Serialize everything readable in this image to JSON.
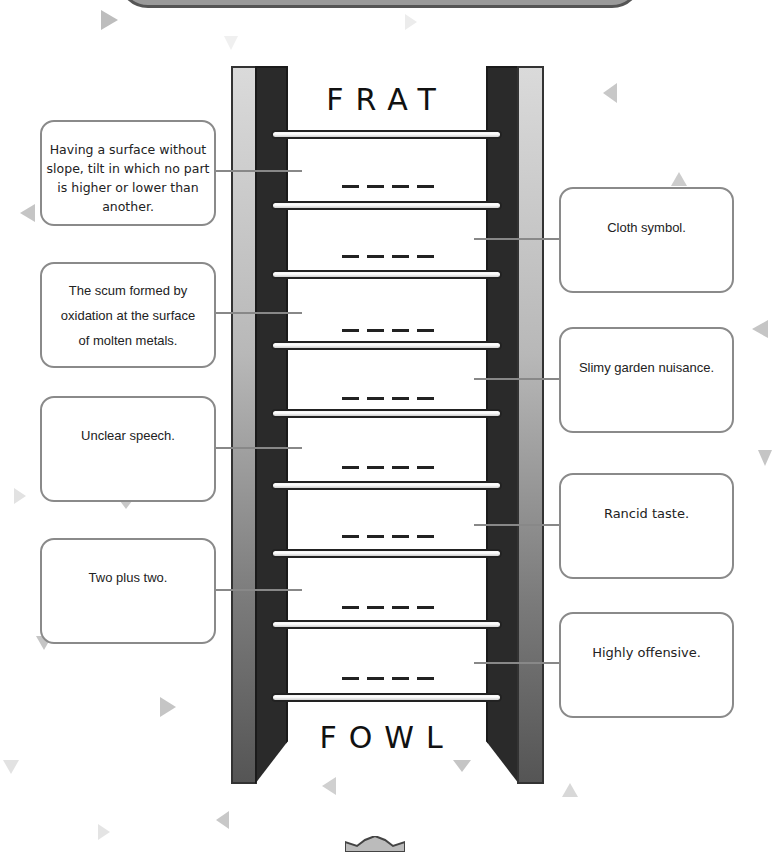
{
  "puzzle": {
    "start_word": "FRAT",
    "end_word": "FOWL",
    "blank_slots": 8,
    "letters_per_word": 4
  },
  "clues": {
    "left": [
      {
        "text": "Having a surface without slope, tilt in which no part is higher or lower than another."
      },
      {
        "text": "The scum formed by oxidation at the surface of molten metals."
      },
      {
        "text": "Unclear speech."
      },
      {
        "text": "Two plus two."
      }
    ],
    "right": [
      {
        "text": "Cloth symbol."
      },
      {
        "text": "Slimy garden nuisance."
      },
      {
        "text": "Rancid taste."
      },
      {
        "text": "Highly offensive."
      }
    ]
  },
  "colors": {
    "rail_dark": "#2a2a2a",
    "rail_light": "#dadada",
    "clue_border": "#8a8a8a",
    "connector": "#888888",
    "decor_triangle": "#c8c8c8"
  }
}
